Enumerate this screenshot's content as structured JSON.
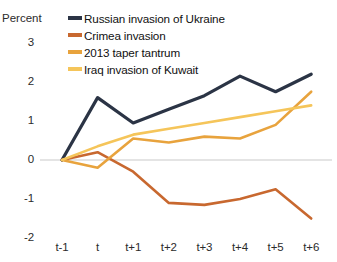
{
  "axis": {
    "unit_label": "Percent",
    "y_ticks": [
      "3",
      "2",
      "1",
      "0",
      "-1",
      "-2"
    ],
    "y_values": [
      3,
      2,
      1,
      0,
      -1,
      -2
    ],
    "x_ticks": [
      "t-1",
      "t",
      "t+1",
      "t+2",
      "t+3",
      "t+4",
      "t+5",
      "t+6"
    ]
  },
  "legend": {
    "items": [
      {
        "label": "Russian invasion of Ukraine",
        "color": "#2b3445"
      },
      {
        "label": "Crimea invasion",
        "color": "#c8682f"
      },
      {
        "label": "2013 taper tantrum",
        "color": "#e8a33d"
      },
      {
        "label": "Iraq invasion of Kuwait",
        "color": "#f5c55a"
      }
    ]
  },
  "chart_data": {
    "type": "line",
    "title": "",
    "subtitle": "",
    "xlabel": "",
    "ylabel": "Percent",
    "ylim": [
      -2,
      3
    ],
    "grid": false,
    "zero_line": true,
    "legend_position": "top-center",
    "categories": [
      "t-1",
      "t",
      "t+1",
      "t+2",
      "t+3",
      "t+4",
      "t+5",
      "t+6"
    ],
    "series": [
      {
        "name": "Russian invasion of Ukraine",
        "color": "#2b3445",
        "values": [
          0,
          1.6,
          0.95,
          1.3,
          1.65,
          2.15,
          1.75,
          2.2
        ]
      },
      {
        "name": "Crimea invasion",
        "color": "#c8682f",
        "values": [
          0,
          0.2,
          -0.3,
          -1.1,
          -1.15,
          -1.0,
          -0.75,
          -1.5
        ]
      },
      {
        "name": "2013 taper tantrum",
        "color": "#e8a33d",
        "values": [
          0,
          -0.2,
          0.55,
          0.45,
          0.6,
          0.55,
          0.9,
          1.75
        ]
      },
      {
        "name": "Iraq invasion of Kuwait",
        "color": "#f5c55a",
        "values": [
          0,
          0.35,
          0.65,
          0.8,
          0.95,
          1.1,
          1.25,
          1.4
        ]
      }
    ]
  }
}
